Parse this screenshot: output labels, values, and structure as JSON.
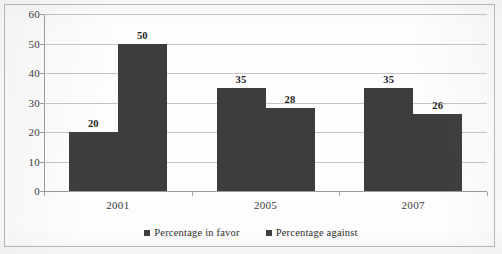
{
  "chart_data": {
    "type": "bar",
    "title": "",
    "subtitle": "",
    "xlabel": "",
    "ylabel": "",
    "categories": [
      "2001",
      "2005",
      "2007"
    ],
    "series": [
      {
        "name": "Percentage in favor",
        "values": [
          20,
          35,
          35
        ],
        "color": "#3d3d3d"
      },
      {
        "name": "Percentage against",
        "values": [
          50,
          28,
          26
        ],
        "color": "#3d3d3d"
      }
    ],
    "ylim": [
      0,
      60
    ],
    "ytick_labels": [
      "60",
      "50",
      "40",
      "30",
      "20",
      "10",
      "0"
    ],
    "ytick_values": [
      60,
      50,
      40,
      30,
      20,
      10,
      0
    ],
    "grid": true,
    "grid_axis": "y",
    "legend_position": "bottom-center",
    "data_labels": true,
    "data_labels_text": [
      "20",
      "50",
      "35",
      "28",
      "35",
      "26"
    ]
  },
  "legend": {
    "items": [
      {
        "label": "Percentage in favor",
        "marker": "square-marker-icon"
      },
      {
        "label": "Percentage against",
        "marker": "square-marker-icon"
      }
    ]
  },
  "axes": {
    "y_ticks": [
      "60",
      "50",
      "40",
      "30",
      "20",
      "10",
      "0"
    ],
    "x_ticks": [
      "2001",
      "2005",
      "2007"
    ]
  },
  "colors": {
    "bar": "#3d3d3d",
    "gridline": "#c5c5c5",
    "axis": "#9a9a9a",
    "border": "#b9b9b9",
    "text": "#3a3a3a"
  }
}
